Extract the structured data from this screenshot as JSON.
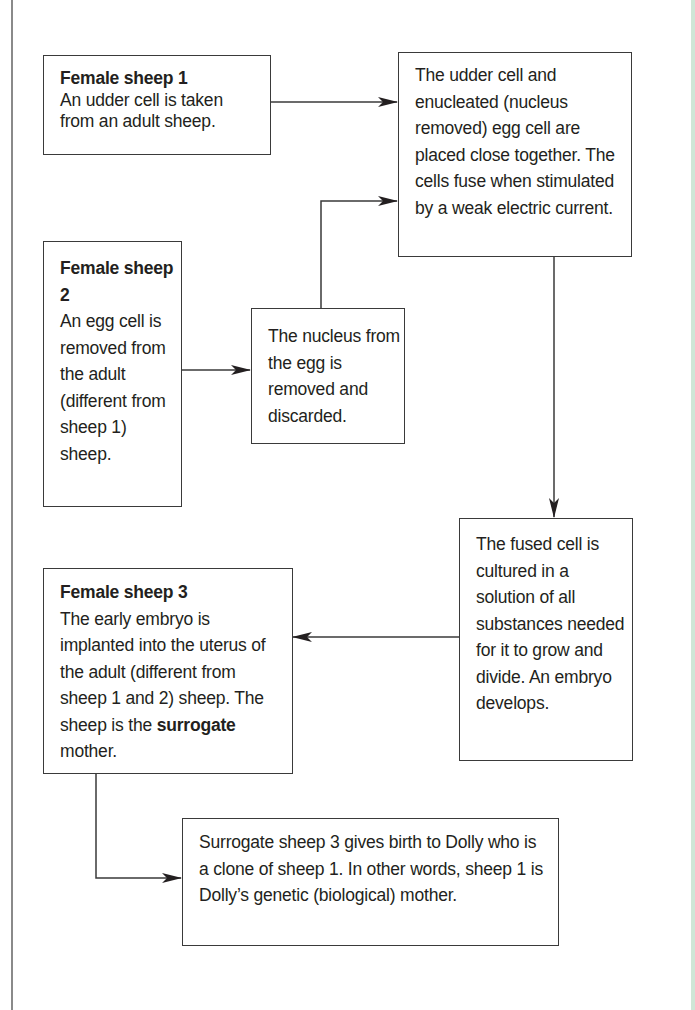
{
  "diagram": {
    "boxes": {
      "sheep1": {
        "title": "Female sheep 1",
        "text": "An udder cell is taken from an adult sheep."
      },
      "fusion": {
        "text": "The udder cell and enucleated (nucleus removed) egg cell are placed close together. The cells fuse when stimulated by a weak electric current."
      },
      "sheep2": {
        "title": "Female sheep 2",
        "text": "An egg cell is removed from the adult (different from sheep 1) sheep."
      },
      "nucleus": {
        "text": "The nucleus from the egg is removed and discarded."
      },
      "fused_cell": {
        "text": "The fused cell is cultured in a solution of all substances needed for it to grow and divide. An embryo develops."
      },
      "sheep3": {
        "title": "Female sheep 3",
        "text": "The early embryo is implanted into the uterus of the adult (different from sheep 1 and 2) sheep. The sheep is the",
        "bold_word": "surrogate",
        "text_end": "mother."
      },
      "dolly": {
        "text": "Surrogate sheep 3 gives birth to Dolly who is a clone of sheep 1. In other words, sheep 1 is Dolly’s genetic (biological) mother."
      }
    },
    "arrows": [
      {
        "from": "sheep1",
        "to": "fusion"
      },
      {
        "from": "sheep2",
        "to": "nucleus"
      },
      {
        "from": "nucleus",
        "to": "fusion"
      },
      {
        "from": "fusion",
        "to": "fused_cell"
      },
      {
        "from": "fused_cell",
        "to": "sheep3"
      },
      {
        "from": "sheep3",
        "to": "dolly"
      }
    ],
    "colors": {
      "line": "#3a3a3a",
      "text": "#231f20",
      "page_border": "#8a8a8a",
      "right_edge": "#cfe6d6"
    }
  }
}
